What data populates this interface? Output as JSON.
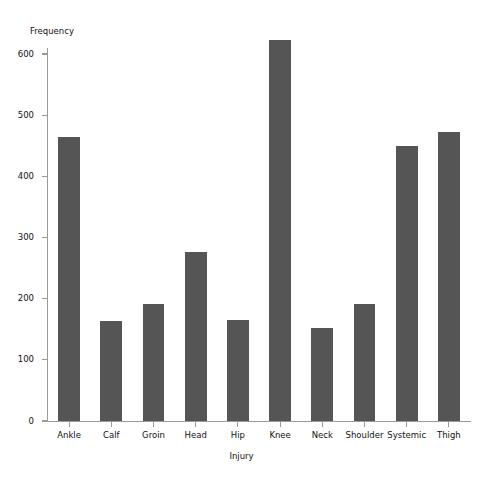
{
  "chart_data": {
    "type": "bar",
    "title": "",
    "xlabel": "Injury",
    "ylabel": "Frequency",
    "categories": [
      "Ankle",
      "Calf",
      "Groin",
      "Head",
      "Hip",
      "Knee",
      "Neck",
      "Shoulder",
      "Systemic",
      "Thigh"
    ],
    "values": [
      465,
      163,
      191,
      277,
      165,
      623,
      152,
      191,
      449,
      472
    ],
    "ylim": [
      0,
      640
    ],
    "yticks": [
      0,
      100,
      200,
      300,
      400,
      500,
      600
    ],
    "ytick_labels": [
      "0",
      "100",
      "200",
      "300",
      "400",
      "500",
      "600"
    ],
    "grid": false,
    "legend": "none",
    "bar_color": "#555555",
    "axis_color": "#9a9a9a",
    "background_color": "#ffffff"
  }
}
